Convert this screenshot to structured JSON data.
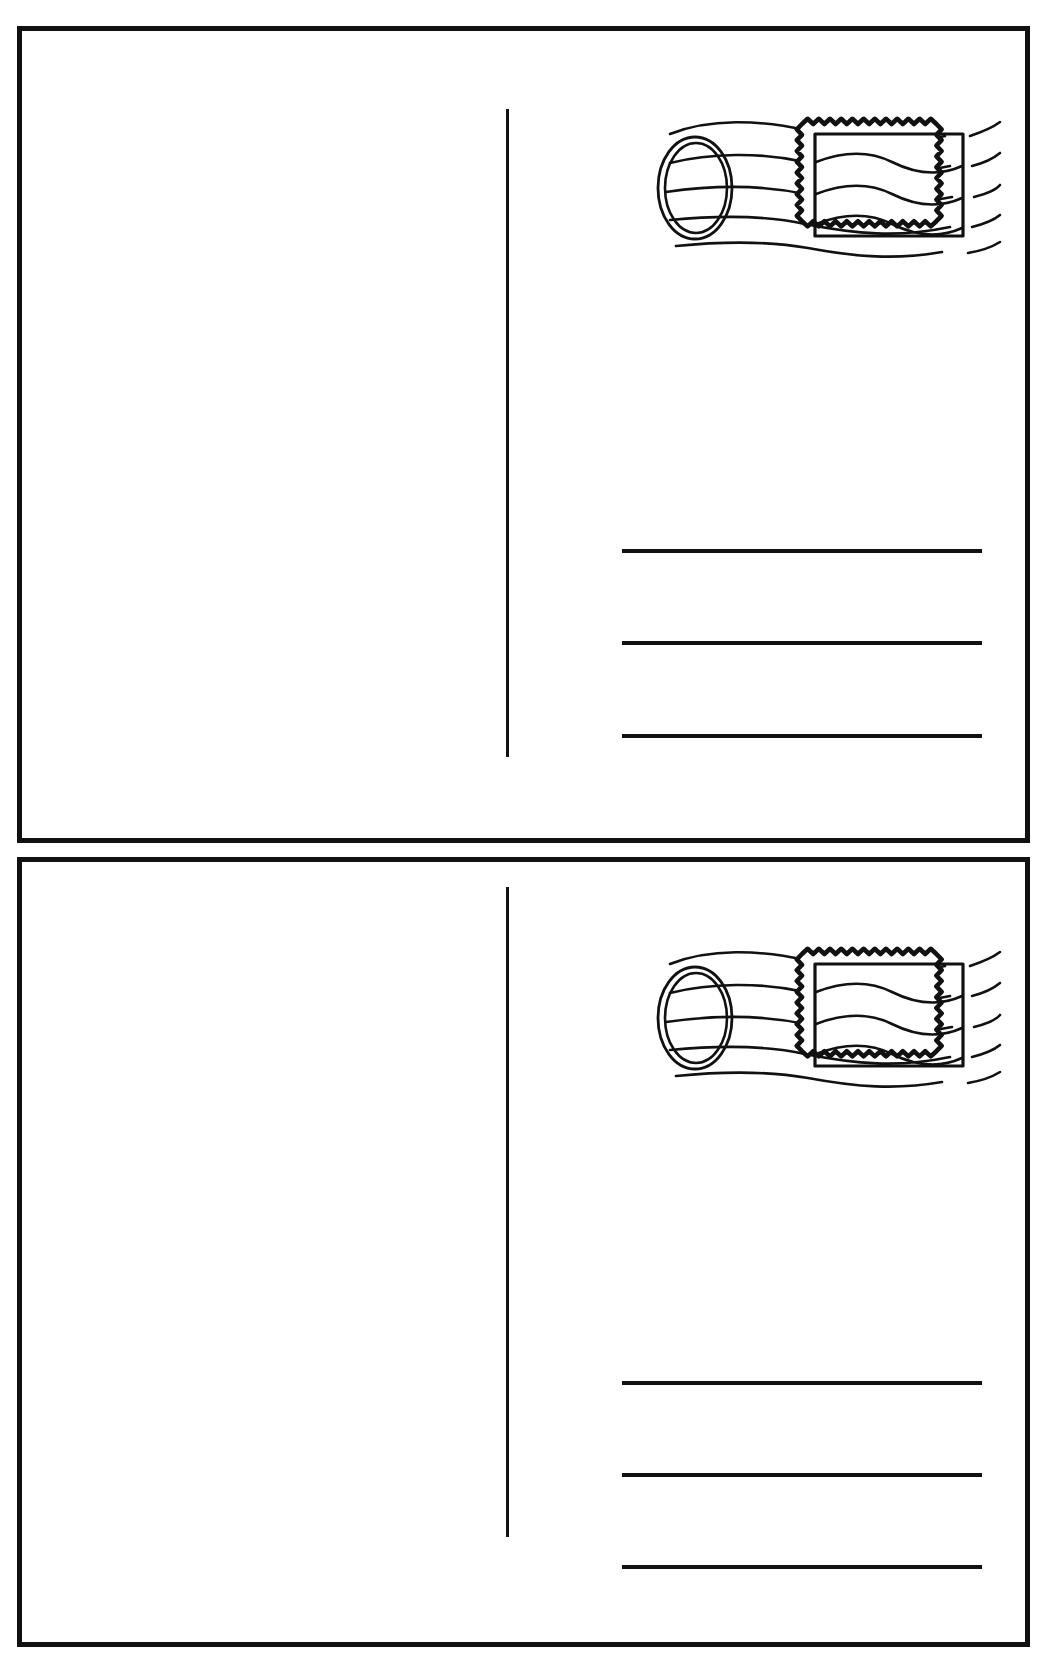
{
  "document": {
    "title": "Blank Postcard Template Worksheet",
    "page_background": "#ffffff",
    "ink_color": "#111111",
    "card_count": 2,
    "orientation": "portrait-sheet-two-landscape-cards"
  },
  "cards": [
    {
      "id": "postcard-1",
      "label": "Postcard 1",
      "message_area": {
        "label": "Message Area",
        "note": ""
      },
      "divider": {
        "label": "Center Divider Line"
      },
      "postmark": {
        "label": "Postmark and Stamp",
        "oval_label": "Cancellation Postmark Oval",
        "stamp_label": "Postage Stamp",
        "wave_count": 5,
        "inner_wave_count": 3,
        "perforation_teeth_horizontal": 23,
        "perforation_teeth_vertical": 17
      },
      "address_lines": [
        {
          "label": "Address Line 1",
          "value": ""
        },
        {
          "label": "Address Line 2",
          "value": ""
        },
        {
          "label": "Address Line 3",
          "value": ""
        }
      ]
    },
    {
      "id": "postcard-2",
      "label": "Postcard 2",
      "message_area": {
        "label": "Message Area",
        "note": ""
      },
      "divider": {
        "label": "Center Divider Line"
      },
      "postmark": {
        "label": "Postmark and Stamp",
        "oval_label": "Cancellation Postmark Oval",
        "stamp_label": "Postage Stamp",
        "wave_count": 5,
        "inner_wave_count": 3,
        "perforation_teeth_horizontal": 23,
        "perforation_teeth_vertical": 17
      },
      "address_lines": [
        {
          "label": "Address Line 1",
          "value": ""
        },
        {
          "label": "Address Line 2",
          "value": ""
        },
        {
          "label": "Address Line 3",
          "value": ""
        }
      ]
    }
  ],
  "colors": {
    "ink": "#111111",
    "paper": "#ffffff",
    "line": "#111111"
  }
}
